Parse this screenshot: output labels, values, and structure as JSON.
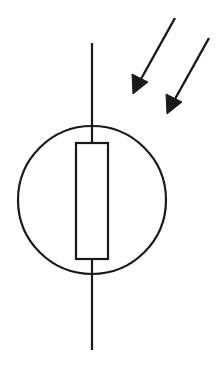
{
  "diagram": {
    "type": "circuit-symbol",
    "symbol": "photoresistor (LDR)",
    "colors": {
      "stroke": "#1a1a1a",
      "background": "#ffffff"
    },
    "elements": {
      "lead": {
        "x": 92,
        "y1": 43,
        "y2": 350
      },
      "envelope_circle": {
        "cx": 92,
        "cy": 200,
        "r": 74
      },
      "resistor_body": {
        "x": 76,
        "y": 143,
        "width": 32,
        "height": 116
      },
      "light_arrows": [
        {
          "x1": 175,
          "y1": 18,
          "x2": 135,
          "y2": 90
        },
        {
          "x1": 209,
          "y1": 38,
          "x2": 169,
          "y2": 110
        }
      ]
    }
  }
}
